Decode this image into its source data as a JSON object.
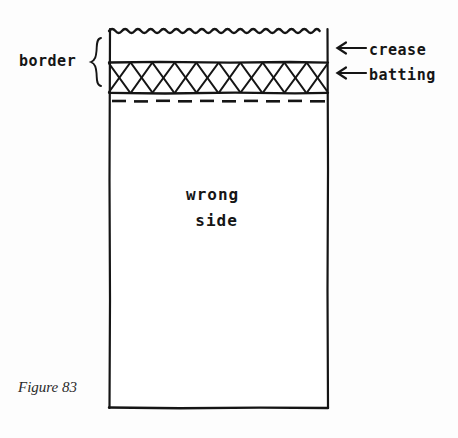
{
  "figure": {
    "caption": "Figure 83",
    "background_color": "#fdfdfd",
    "ink_color": "#151515",
    "style": "hand-drawn sewing / quilting instructional diagram"
  },
  "labels": {
    "border": "border",
    "crease": "crease",
    "batting": "batting",
    "wrong_side_line1": "wrong",
    "wrong_side_line2": "side"
  },
  "icons": {
    "brace": "curly-brace-right",
    "crease_arrow": "arrow-left-icon",
    "batting_arrow": "arrow-left-icon"
  },
  "diagram": {
    "fabric_panel": {
      "left": 109,
      "right": 328,
      "top": 28,
      "bottom": 408,
      "fill": "#ffffff",
      "stroke": "#151515"
    },
    "edges": {
      "top_edge_style": "wavy-scalloped-raw-edge",
      "top_edge_y": 29,
      "crease_line_y": 62,
      "batting_band_top_y": 63,
      "batting_band_bottom_y": 93,
      "dashed_stitch_line_y": 101,
      "bottom_edge_y": 408,
      "side_edge_style": "straight"
    },
    "batting_fill": {
      "pattern": "crosshatch-x",
      "x_count": 10
    },
    "brace": {
      "x": 93,
      "top": 38,
      "bottom": 96,
      "spans": "border region from raw wavy edge to dashed stitch line"
    },
    "arrows": [
      {
        "name": "crease-arrow",
        "points_to": "crease line",
        "x_start": 366,
        "x_end": 337,
        "y": 48
      },
      {
        "name": "batting-arrow",
        "points_to": "batting band",
        "x_start": 366,
        "x_end": 337,
        "y": 73
      }
    ]
  }
}
